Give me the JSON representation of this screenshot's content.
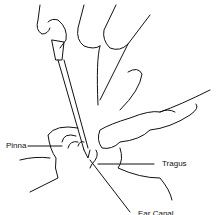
{
  "figure": {
    "labels": {
      "pinna": "Pinna",
      "tragus": "Tragus",
      "canal": "Ear Canal"
    }
  }
}
